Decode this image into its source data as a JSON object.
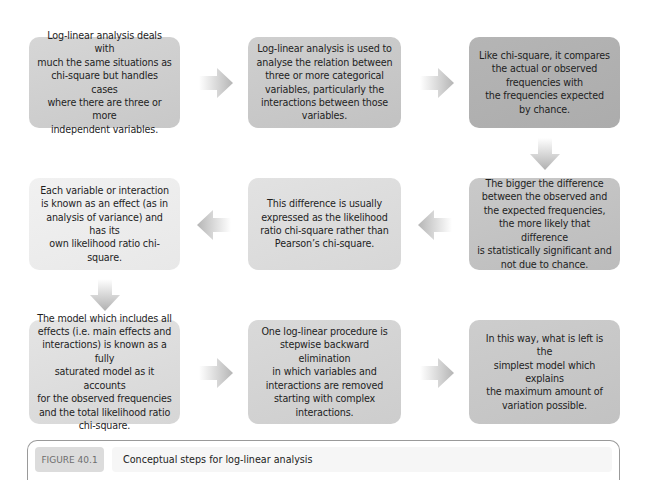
{
  "figure": {
    "badge": "FIGURE 40.1",
    "caption": "Conceptual steps for log-linear analysis"
  },
  "colors": {
    "box_light": "#efefef",
    "box_mid_light": "#e2e2e2",
    "box_mid": "#d0d0d0",
    "box_dark": "#b4b4b4",
    "arrow": "#b9b9b9"
  },
  "steps": [
    {
      "id": 1,
      "lines": [
        "Log-linear analysis deals with",
        "much the same situations as",
        "chi-square but handles cases",
        "where there are three or more",
        "independent variables."
      ]
    },
    {
      "id": 2,
      "lines": [
        "Log-linear analysis is used to",
        "analyse the relation between",
        "three or more categorical",
        "variables, particularly the",
        "interactions between those",
        "variables."
      ]
    },
    {
      "id": 3,
      "lines": [
        "Like chi-square, it compares",
        "the actual or observed",
        "frequencies with",
        "the frequencies expected",
        "by chance."
      ]
    },
    {
      "id": 4,
      "lines": [
        "The bigger the difference",
        "between the observed and",
        "the expected frequencies,",
        "the more likely that difference",
        "is statistically significant and",
        "not due to chance."
      ]
    },
    {
      "id": 5,
      "lines": [
        "This difference is usually",
        "expressed as the likelihood",
        "ratio chi-square rather than",
        "Pearson’s chi-square."
      ]
    },
    {
      "id": 6,
      "lines": [
        "Each variable or interaction",
        "is known as an effect (as in",
        "analysis of variance) and has its",
        "own likelihood ratio chi-square."
      ]
    },
    {
      "id": 7,
      "lines": [
        "The model which includes all",
        "effects (i.e. main effects and",
        "interactions) is known as a fully",
        "saturated model as it accounts",
        "for the observed frequencies",
        "and the total likelihood ratio",
        "chi-square."
      ]
    },
    {
      "id": 8,
      "lines": [
        "One log-linear procedure is",
        "stepwise backward elimination",
        "in which variables and",
        "interactions are removed",
        "starting with complex",
        "interactions."
      ]
    },
    {
      "id": 9,
      "lines": [
        "In this way, what is left is the",
        "simplest model which explains",
        "the maximum amount of",
        "variation possible."
      ]
    }
  ],
  "arrows": [
    {
      "from": 1,
      "to": 2,
      "direction": "right"
    },
    {
      "from": 2,
      "to": 3,
      "direction": "right"
    },
    {
      "from": 3,
      "to": 4,
      "direction": "down"
    },
    {
      "from": 4,
      "to": 5,
      "direction": "left"
    },
    {
      "from": 5,
      "to": 6,
      "direction": "left"
    },
    {
      "from": 6,
      "to": 7,
      "direction": "down"
    },
    {
      "from": 7,
      "to": 8,
      "direction": "right"
    },
    {
      "from": 8,
      "to": 9,
      "direction": "right"
    }
  ]
}
